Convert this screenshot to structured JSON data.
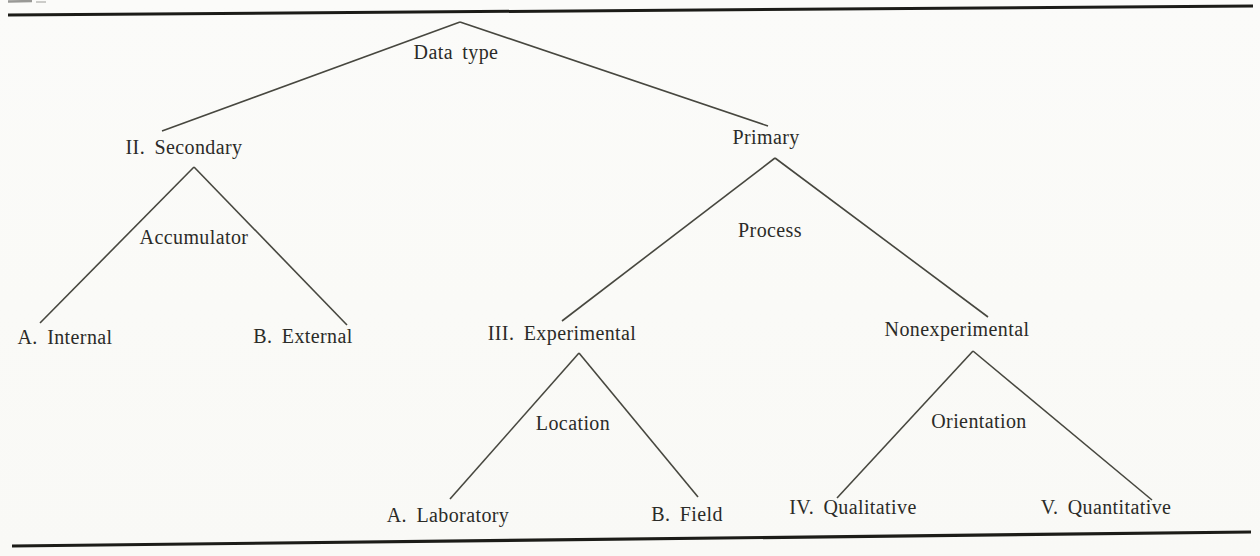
{
  "page": {
    "background": "#fafaf7",
    "ink_color": "#2b2b28",
    "edge_line_color": "#47473f",
    "rule_color": "#1c1c18"
  },
  "tree": {
    "root": {
      "label": "Data type",
      "children": [
        {
          "label": "II. Secondary",
          "split_label": "Accumulator",
          "children": [
            {
              "label": "A. Internal"
            },
            {
              "label": "B. External"
            }
          ]
        },
        {
          "label": "Primary",
          "split_label": "Process",
          "children": [
            {
              "label": "III. Experimental",
              "split_label": "Location",
              "children": [
                {
                  "label": "A. Laboratory"
                },
                {
                  "label": "B. Field"
                }
              ]
            },
            {
              "label": "Nonexperimental",
              "split_label": "Orientation",
              "children": [
                {
                  "label": "IV. Qualitative"
                },
                {
                  "label": "V. Quantitative"
                }
              ]
            }
          ]
        }
      ]
    }
  }
}
